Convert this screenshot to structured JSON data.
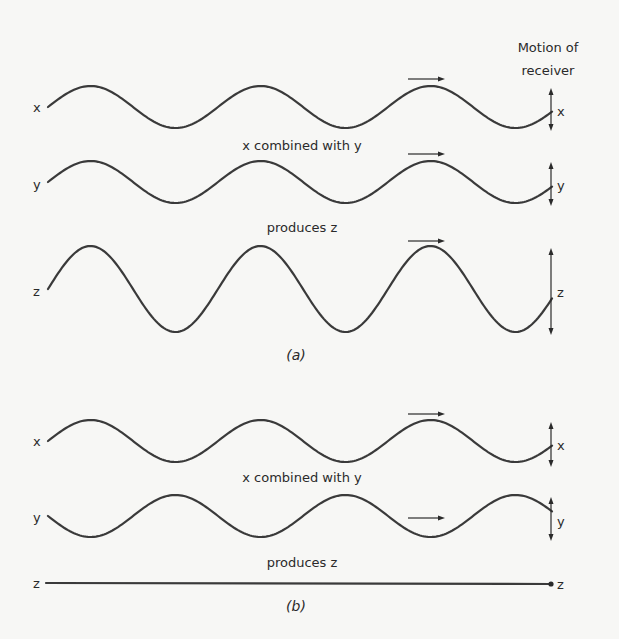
{
  "header": {
    "motion_line1": "Motion of",
    "motion_line2": "receiver"
  },
  "panel_a": {
    "caption": "(a)",
    "combined_label": "x combined with y",
    "produces_label": "produces z",
    "waves": [
      {
        "name": "x",
        "left_label": "x",
        "right_label": "x",
        "center_y": 107,
        "amplitude": 21,
        "phase": 1,
        "arrow_y": 79,
        "vert": [
          88,
          131
        ]
      },
      {
        "name": "y",
        "left_label": "y",
        "right_label": "y",
        "center_y": 182,
        "amplitude": 21,
        "phase": 1,
        "arrow_y": 154,
        "vert": [
          162,
          206
        ]
      },
      {
        "name": "z",
        "left_label": "z",
        "right_label": "z",
        "center_y": 289,
        "amplitude": 43,
        "phase": 1,
        "arrow_y": 241,
        "vert": [
          248,
          335
        ]
      }
    ]
  },
  "panel_b": {
    "caption": "(b)",
    "combined_label": "x combined with y",
    "produces_label": "produces z",
    "waves": [
      {
        "name": "x",
        "left_label": "x",
        "right_label": "x",
        "center_y": 441,
        "amplitude": 21,
        "phase": 1,
        "arrow_y": 414,
        "vert": [
          422,
          467
        ]
      },
      {
        "name": "y",
        "left_label": "y",
        "right_label": "y",
        "center_y": 516,
        "amplitude": 21,
        "phase": -1,
        "arrow_y": 518,
        "vert": [
          497,
          541
        ]
      },
      {
        "name": "z",
        "left_label": "z",
        "right_label": "z",
        "center_y": 583,
        "amplitude": 0,
        "phase": 1,
        "flat": true
      }
    ]
  },
  "geometry": {
    "x_start": 48,
    "x_end": 552,
    "period": 170,
    "arrow_x1": 408,
    "arrow_x2": 445
  },
  "colors": {
    "ink": "#2a2a2a",
    "paper": "#f7f7f5"
  }
}
